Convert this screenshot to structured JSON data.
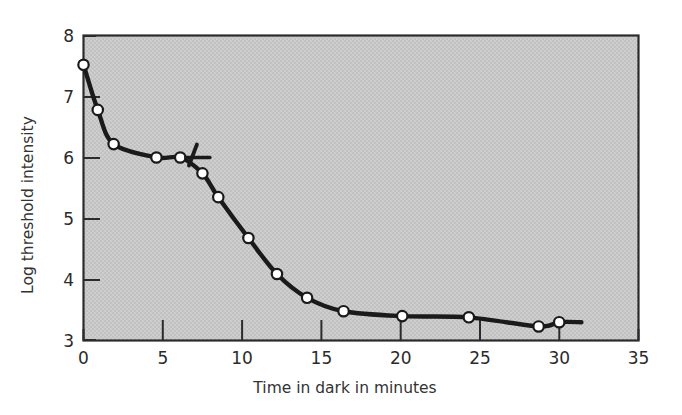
{
  "figure": {
    "background_color": "#ffffff",
    "plot_background_color": "#c9c9c9",
    "plot_border_color": "#2b2b2b",
    "curve_color": "#1a1a1a",
    "marker_fill_color": "#ffffff",
    "marker_edge_color": "#1a1a1a"
  },
  "labels": {
    "xlabel": "Time in dark in minutes",
    "ylabel": "Log threshold intensity"
  },
  "axes": {
    "x_ticks": [
      "0",
      "5",
      "10",
      "15",
      "20",
      "25",
      "30",
      "35"
    ],
    "y_ticks": [
      "8",
      "7",
      "6",
      "5",
      "4",
      "3"
    ]
  },
  "chart_data": {
    "type": "line",
    "title": "",
    "xlabel": "Time in dark in minutes",
    "ylabel": "Log threshold intensity",
    "xlim": [
      0,
      35
    ],
    "ylim": [
      3,
      8
    ],
    "xtick_values": [
      0,
      5,
      10,
      15,
      20,
      25,
      30,
      35
    ],
    "ytick_values": [
      3,
      4,
      5,
      6,
      7,
      8
    ],
    "grid": false,
    "legend": null,
    "series": [
      {
        "name": "Log threshold intensity",
        "marker": "open-circle",
        "x": [
          0.0,
          0.9,
          1.9,
          4.6,
          6.1,
          7.5,
          8.5,
          10.4,
          12.2,
          14.1,
          16.4,
          20.1,
          24.3,
          28.7,
          30.0
        ],
        "y": [
          7.52,
          6.78,
          6.22,
          6.0,
          6.0,
          5.74,
          5.35,
          4.68,
          4.09,
          3.7,
          3.48,
          3.4,
          3.38,
          3.23,
          3.3
        ]
      }
    ],
    "annotations": [
      {
        "name": "cone-rod-break-marker",
        "type": "cross-tick",
        "x": 6.9,
        "y": 6.0,
        "description": "short horizontal segment crossed by a short diagonal stroke marking the cone-rod break"
      }
    ],
    "curve_extends_to_x": 31.4
  }
}
